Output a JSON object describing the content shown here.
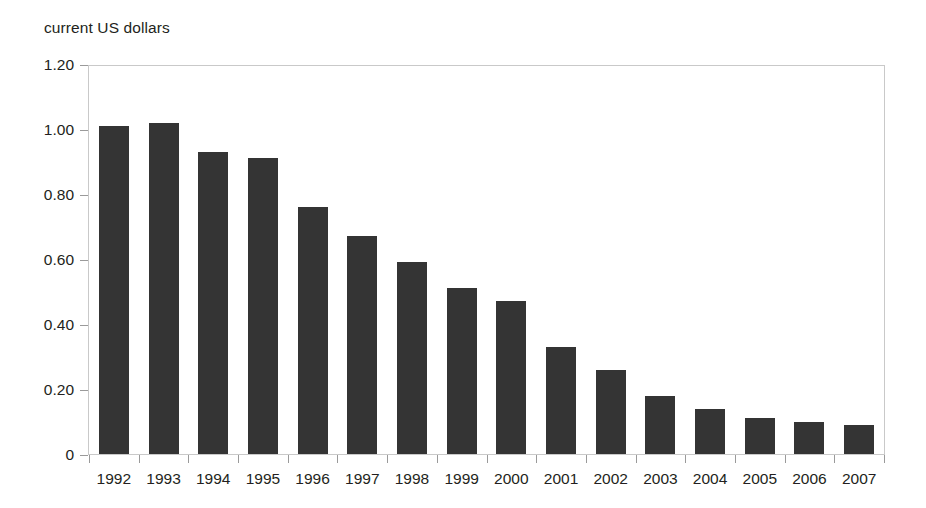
{
  "chart_data": {
    "type": "bar",
    "title": "",
    "axis_caption": "current US dollars",
    "xlabel": "",
    "ylabel": "current US dollars",
    "ylim": [
      0,
      1.2
    ],
    "ytick_labels": [
      "1.20",
      "1.00",
      "0.80",
      "0.60",
      "0.40",
      "0.20",
      "0"
    ],
    "ytick_values": [
      1.2,
      1.0,
      0.8,
      0.6,
      0.4,
      0.2,
      0
    ],
    "grid": false,
    "legend": "none",
    "bar_color": "#343434",
    "frame_color": "#c9c9c9",
    "categories": [
      "1992",
      "1993",
      "1994",
      "1995",
      "1996",
      "1997",
      "1998",
      "1999",
      "2000",
      "2001",
      "2002",
      "2003",
      "2004",
      "2005",
      "2006",
      "2007"
    ],
    "values": [
      1.01,
      1.02,
      0.93,
      0.91,
      0.76,
      0.67,
      0.59,
      0.51,
      0.47,
      0.33,
      0.26,
      0.18,
      0.14,
      0.11,
      0.1,
      0.09
    ]
  }
}
